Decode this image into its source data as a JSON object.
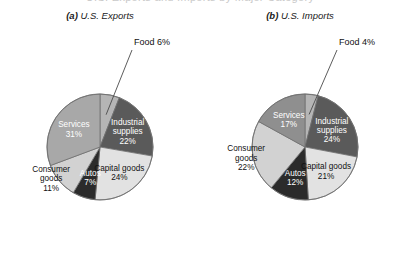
{
  "figure": {
    "cropped_top_text": "U.S. Exports and Imports by Major Category",
    "background": "#ffffff"
  },
  "chart_data": [
    {
      "type": "pie",
      "id": "us-exports",
      "tag": "(a)",
      "title": "U.S. Exports",
      "title_full": "(a) U.S. Exports",
      "start_angle_deg": 0,
      "direction": "clockwise",
      "categories": [
        "Food",
        "Industrial supplies",
        "Capital goods",
        "Autos",
        "Consumer goods",
        "Services"
      ],
      "values": [
        6,
        22,
        24,
        7,
        11,
        31
      ],
      "unit": "%",
      "slices": [
        {
          "label": "Food",
          "value": 6,
          "value_text": "6%",
          "label_text": "Food 6%",
          "color": "#b5b5b5",
          "text_color": "#111111",
          "placement": "callout"
        },
        {
          "label": "Industrial supplies",
          "value": 22,
          "value_text": "22%",
          "label_line_1": "Industrial",
          "label_line_2": "supplies",
          "color": "#5a5a5a",
          "text_color": "#ffffff",
          "placement": "inside"
        },
        {
          "label": "Capital goods",
          "value": 24,
          "value_text": "24%",
          "label_line_1": "Capital goods",
          "color": "#e2e2e2",
          "text_color": "#111111",
          "placement": "inside"
        },
        {
          "label": "Autos",
          "value": 7,
          "value_text": "7%",
          "label_line_1": "Autos",
          "color": "#2b2b2b",
          "text_color": "#ffffff",
          "placement": "inside"
        },
        {
          "label": "Consumer goods",
          "value": 11,
          "value_text": "11%",
          "label_line_1": "Consumer",
          "label_line_2": "goods",
          "color": "#d2d2d2",
          "text_color": "#111111",
          "placement": "outside-left"
        },
        {
          "label": "Services",
          "value": 31,
          "value_text": "31%",
          "label_line_1": "Services",
          "color": "#a8a8a8",
          "text_color": "#ffffff",
          "placement": "inside"
        }
      ]
    },
    {
      "type": "pie",
      "id": "us-imports",
      "tag": "(b)",
      "title": "U.S. Imports",
      "title_full": "(b) U.S. Imports",
      "start_angle_deg": 0,
      "direction": "clockwise",
      "categories": [
        "Food",
        "Industrial supplies",
        "Capital goods",
        "Autos",
        "Consumer goods",
        "Services"
      ],
      "values": [
        4,
        24,
        21,
        12,
        22,
        17
      ],
      "unit": "%",
      "slices": [
        {
          "label": "Food",
          "value": 4,
          "value_text": "4%",
          "label_text": "Food 4%",
          "color": "#b5b5b5",
          "text_color": "#111111",
          "placement": "callout"
        },
        {
          "label": "Industrial supplies",
          "value": 24,
          "value_text": "24%",
          "label_line_1": "Industrial",
          "label_line_2": "supplies",
          "color": "#5a5a5a",
          "text_color": "#ffffff",
          "placement": "inside"
        },
        {
          "label": "Capital goods",
          "value": 21,
          "value_text": "21%",
          "label_line_1": "Capital goods",
          "color": "#e2e2e2",
          "text_color": "#111111",
          "placement": "inside"
        },
        {
          "label": "Autos",
          "value": 12,
          "value_text": "12%",
          "label_line_1": "Autos",
          "color": "#2b2b2b",
          "text_color": "#ffffff",
          "placement": "inside"
        },
        {
          "label": "Consumer goods",
          "value": 22,
          "value_text": "22%",
          "label_line_1": "Consumer",
          "label_line_2": "goods",
          "color": "#d2d2d2",
          "text_color": "#111111",
          "placement": "outside-left"
        },
        {
          "label": "Services",
          "value": 17,
          "value_text": "17%",
          "label_line_1": "Services",
          "color": "#8f8f8f",
          "text_color": "#ffffff",
          "placement": "inside"
        }
      ]
    }
  ],
  "geometry": {
    "exports": {
      "cx": 100,
      "cy": 147,
      "r": 53
    },
    "imports": {
      "cx": 105,
      "cy": 147,
      "r": 53
    }
  }
}
